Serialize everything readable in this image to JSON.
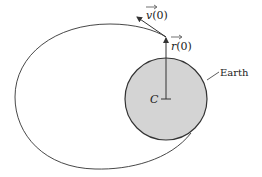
{
  "diagram": {
    "type": "orbit-diagram",
    "labels": {
      "velocity": "v(0)",
      "position": "r(0)",
      "center": "C",
      "earth": "Earth"
    },
    "colors": {
      "earth_fill": "#d4d4d4",
      "stroke": "#333333",
      "background": "#ffffff"
    }
  }
}
